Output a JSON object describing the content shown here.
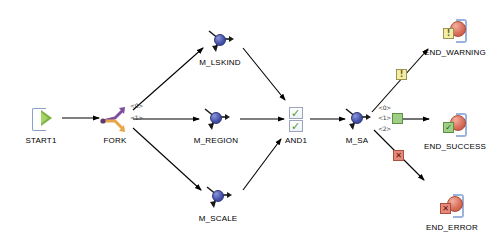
{
  "diagram": {
    "background": "#ffffff",
    "edge_color": "#000000"
  },
  "nodes": {
    "start": {
      "label": "START1",
      "icon": "start-gate-icon",
      "x": 41,
      "y": 120
    },
    "fork": {
      "label": "FORK",
      "icon": "fork-arrows-icon",
      "x": 115,
      "y": 120
    },
    "lskind": {
      "label": "M_LSKIND",
      "icon": "mapping-sphere-icon",
      "x": 220,
      "y": 42
    },
    "region": {
      "label": "M_REGION",
      "icon": "mapping-sphere-icon",
      "x": 216,
      "y": 120
    },
    "scale": {
      "label": "M_SCALE",
      "icon": "mapping-sphere-icon",
      "x": 218,
      "y": 198
    },
    "and": {
      "label": "AND1",
      "icon": "and-checkbox-icon",
      "x": 296,
      "y": 120
    },
    "sa": {
      "label": "M_SA",
      "icon": "mapping-sphere-icon",
      "x": 357,
      "y": 120
    },
    "end_warning": {
      "label": "END_WARNING",
      "icon": "end-warning-icon",
      "badge": "!",
      "x": 455,
      "y": 32
    },
    "end_success": {
      "label": "END_SUCCESS",
      "icon": "end-success-icon",
      "badge": "✓",
      "x": 455,
      "y": 126
    },
    "end_error": {
      "label": "END_ERROR",
      "icon": "end-error-icon",
      "badge": "✕",
      "x": 452,
      "y": 207
    }
  },
  "edge_labels": {
    "fork_0": "<0>",
    "fork_1": "<1>",
    "sa_0": "<0>",
    "sa_1": "<1>",
    "sa_2": "<2>"
  },
  "edge_markers": {
    "warning": {
      "glyph": "!",
      "color": "#f2eea8",
      "name": "warning-marker"
    },
    "success": {
      "glyph": "■",
      "color": "#9fcf86",
      "name": "success-marker"
    },
    "error": {
      "glyph": "✕",
      "color": "#e6897a",
      "name": "error-marker"
    }
  },
  "colors": {
    "sphere_blue": "#4a55ad",
    "sphere_red": "#d9715c",
    "check_green": "#4b9b35",
    "bracket_blue": "#9ab3dd",
    "fork_purple": "#7b4f9e",
    "fork_orange": "#e8a64a",
    "play_green": "#7cb342"
  }
}
